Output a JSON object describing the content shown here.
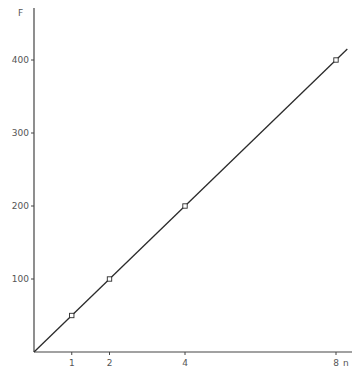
{
  "chart_data": {
    "type": "line",
    "title": "",
    "xlabel": "n",
    "ylabel": "F",
    "xlim": [
      0,
      8.3
    ],
    "ylim": [
      0,
      430
    ],
    "x_ticks": [
      1,
      2,
      4,
      8
    ],
    "x_tick_labels": [
      "1",
      "2",
      "4",
      "8"
    ],
    "y_ticks": [
      100,
      200,
      300,
      400
    ],
    "y_tick_labels": [
      "100",
      "200",
      "300",
      "400"
    ],
    "grid": false,
    "legend": null,
    "series": [
      {
        "name": "F vs n",
        "marker": "open-square",
        "points": [
          {
            "x": 1,
            "y": 50
          },
          {
            "x": 2,
            "y": 100
          },
          {
            "x": 4,
            "y": 200
          },
          {
            "x": 8,
            "y": 400
          }
        ],
        "fit_line": {
          "slope": 50,
          "intercept": 0,
          "x_range": [
            0,
            8.3
          ]
        }
      }
    ],
    "colors": {
      "line": "#2b2b2b",
      "axis": "#444444",
      "text": "#555555"
    }
  },
  "labels": {
    "y_title": "F",
    "x_title": "n"
  }
}
